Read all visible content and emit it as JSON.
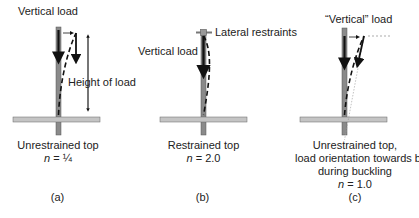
{
  "panels": [
    {
      "id": "a",
      "labels": {
        "load": "Vertical load",
        "height": "Height of load"
      },
      "caption": {
        "line1": "Unrestrained top",
        "n_var": "n",
        "n_value": "= ¼"
      },
      "tag": "(a)"
    },
    {
      "id": "b",
      "labels": {
        "load": "Vertical load",
        "restraint": "Lateral restraints"
      },
      "caption": {
        "line1": "Restrained top",
        "n_var": "n",
        "n_value": "= 2.0"
      },
      "tag": "(b)"
    },
    {
      "id": "c",
      "labels": {
        "load": "“Vertical” load"
      },
      "caption": {
        "line1": "Unrestrained top,",
        "line2": "load orientation towards base",
        "line3": "during buckling",
        "n_var": "n",
        "n_value": "= 1.0"
      },
      "tag": "(c)"
    }
  ],
  "colors": {
    "post": "#8a8a8a",
    "beam": "#c4c4c4",
    "ink": "#111111"
  }
}
